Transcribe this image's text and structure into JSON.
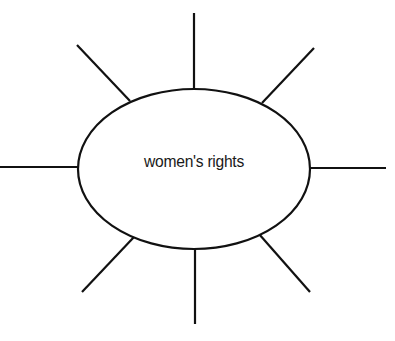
{
  "diagram": {
    "type": "spider-map",
    "center_label": "women's rights",
    "spoke_count": 8,
    "colors": {
      "stroke": "#111111",
      "background": "#ffffff"
    }
  }
}
